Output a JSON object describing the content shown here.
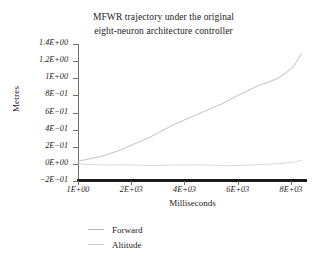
{
  "chart_data": {
    "type": "line",
    "title": "MFWR trajectory under the original eight-neuron architecture controller",
    "title_lines": [
      "MFWR trajectory under the original",
      "eight-neuron architecture controller"
    ],
    "xlabel": "Milliseconds",
    "ylabel": "Metres",
    "grid": false,
    "legend_position": "bottom-left",
    "xlim": [
      1,
      8600
    ],
    "ylim": [
      -0.2,
      1.4
    ],
    "xticks": [
      1,
      2000,
      4000,
      6000,
      8000
    ],
    "xtick_labels": [
      "1E+00",
      "2E+03",
      "4E+03",
      "6E+03",
      "8E+03"
    ],
    "yticks": [
      -0.2,
      0,
      0.2,
      0.4,
      0.6,
      0.8,
      1.0,
      1.2,
      1.4
    ],
    "ytick_labels": [
      "1.4E+00",
      "1.2E+00",
      "1E+00",
      "8E−01",
      "6E−01",
      "4E−01",
      "2E−01",
      "0E+00",
      "−2E−01"
    ],
    "x": [
      1,
      300,
      600,
      900,
      1200,
      1500,
      1800,
      2100,
      2400,
      2700,
      3000,
      3300,
      3600,
      3900,
      4200,
      4500,
      4800,
      5100,
      5400,
      5700,
      6000,
      6300,
      6600,
      6900,
      7200,
      7500,
      7800,
      8100,
      8400
    ],
    "series": [
      {
        "name": "Forward",
        "color": "#b9b9b9",
        "values": [
          0.03,
          0.05,
          0.07,
          0.09,
          0.12,
          0.15,
          0.19,
          0.23,
          0.27,
          0.31,
          0.36,
          0.41,
          0.46,
          0.5,
          0.54,
          0.58,
          0.62,
          0.66,
          0.7,
          0.75,
          0.8,
          0.84,
          0.89,
          0.93,
          0.96,
          1.0,
          1.06,
          1.14,
          1.29
        ]
      },
      {
        "name": "Altitude",
        "color": "#cfcfcf",
        "values": [
          0.0,
          -0.005,
          -0.01,
          -0.012,
          -0.012,
          -0.011,
          -0.012,
          -0.014,
          -0.016,
          -0.018,
          -0.018,
          -0.016,
          -0.014,
          -0.013,
          -0.012,
          -0.011,
          -0.012,
          -0.016,
          -0.02,
          -0.022,
          -0.02,
          -0.016,
          -0.012,
          -0.008,
          -0.004,
          0.002,
          0.01,
          0.022,
          0.04
        ]
      }
    ]
  },
  "legend": {
    "items": [
      {
        "label": "Forward"
      },
      {
        "label": "Altitude"
      }
    ]
  }
}
